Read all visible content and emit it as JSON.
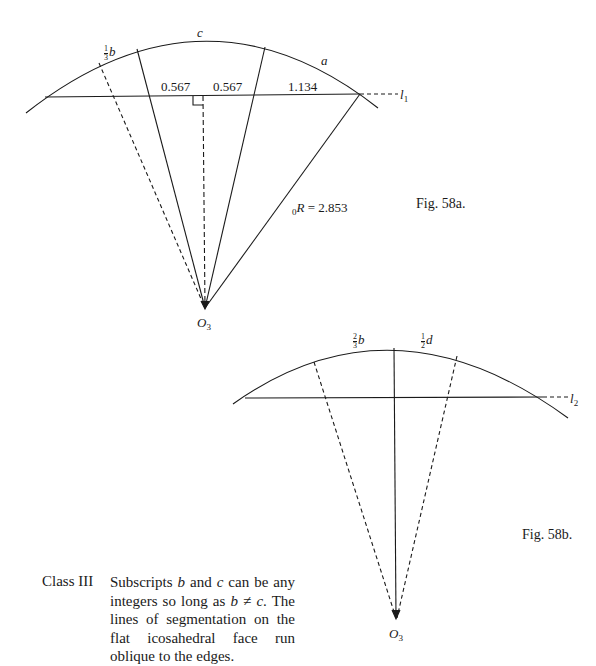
{
  "fig_a": {
    "caption": "Fig. 58a.",
    "arc_labels": {
      "b_frac_num": "1",
      "b_frac_den": "3",
      "b_var": "b",
      "c": "c",
      "a": "a"
    },
    "segments": [
      "0.567",
      "0.567",
      "1.134"
    ],
    "line_label": "l",
    "line_label_sub": "1",
    "radius_prefix_sub": "0",
    "radius_var": "R",
    "radius_value": " = 2.853",
    "center_label": "O",
    "center_label_sub": "3"
  },
  "fig_b": {
    "caption": "Fig. 58b.",
    "arc_labels": {
      "b_frac_num": "2",
      "b_frac_den": "3",
      "b_var": "b",
      "d_frac_num": "1",
      "d_frac_den": "2",
      "d_var": "d"
    },
    "line_label": "l",
    "line_label_sub": "2",
    "center_label": "O",
    "center_label_sub": "3"
  },
  "text_block": {
    "class_label": "Class III",
    "description_parts": {
      "p1": "Subscripts ",
      "b": "b",
      "p2": " and ",
      "c": "c",
      "p3": " can be any integers so long as ",
      "b2": "b",
      "neq": " ≠ ",
      "c2": "c",
      "p4": ". The lines of segmentation on the flat icosahedral face run oblique to the edges."
    }
  },
  "colors": {
    "ink": "#1a1a1a",
    "background": "#ffffff"
  }
}
